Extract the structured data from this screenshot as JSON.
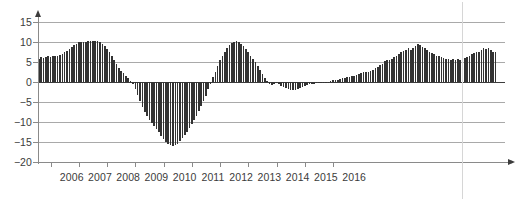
{
  "chart_data": {
    "type": "bar",
    "title": "",
    "subtitle": "",
    "xlabel": "",
    "ylabel": "",
    "grid": true,
    "legend": null,
    "ylim": [
      -20,
      15
    ],
    "ytick_labels": [
      "15",
      "10",
      "5",
      "0",
      "−5",
      "−10",
      "−15",
      "−20"
    ],
    "ytick_values": [
      15,
      10,
      5,
      0,
      -5,
      -10,
      -15,
      -20
    ],
    "xtick_labels": [
      "2006",
      "2007",
      "2008",
      "2009",
      "2010",
      "2011",
      "2012",
      "2013",
      "2014",
      "2015",
      "2016"
    ],
    "xtick_values": [
      2006,
      2007,
      2008,
      2009,
      2010,
      2011,
      2012,
      2013,
      2014,
      2015,
      2016
    ],
    "bar_color": "#333333",
    "gridline_color": "#a9a9a9",
    "zero_line_color": "#3c3c3c",
    "marker_line_color": "#d6d6d6",
    "x_start": 2005.55,
    "x_step": 0.0833333,
    "values": [
      5.8,
      6.2,
      6.1,
      6.3,
      6.4,
      6.3,
      6.5,
      6.4,
      6.6,
      6.8,
      7.0,
      7.4,
      7.8,
      8.2,
      8.8,
      9.2,
      9.6,
      10.0,
      10.1,
      10.1,
      10.1,
      10.2,
      10.2,
      10.3,
      10.3,
      10.2,
      10.0,
      9.6,
      9.0,
      8.2,
      7.4,
      6.4,
      5.4,
      4.4,
      3.6,
      2.8,
      2.2,
      1.6,
      0.9,
      0.2,
      -0.6,
      -1.8,
      -3.2,
      -4.8,
      -6.2,
      -7.6,
      -8.6,
      -9.4,
      -10.2,
      -11.0,
      -11.8,
      -12.6,
      -13.4,
      -14.2,
      -14.9,
      -15.4,
      -15.8,
      -16.0,
      -15.8,
      -15.4,
      -14.8,
      -14.0,
      -13.2,
      -12.4,
      -11.4,
      -10.4,
      -9.4,
      -8.4,
      -7.2,
      -6.0,
      -4.8,
      -3.4,
      -1.8,
      -0.4,
      1.2,
      2.6,
      4.0,
      5.4,
      6.6,
      7.6,
      8.4,
      9.2,
      9.8,
      10.1,
      10.2,
      10.1,
      9.6,
      9.0,
      8.2,
      7.4,
      6.6,
      5.8,
      5.0,
      4.0,
      3.0,
      2.0,
      1.0,
      0.2,
      -0.4,
      -0.8,
      -0.5,
      -0.3,
      -0.6,
      -0.9,
      -1.2,
      -1.5,
      -1.8,
      -2.0,
      -2.1,
      -2.0,
      -1.8,
      -1.5,
      -1.2,
      -0.9,
      -0.7,
      -0.6,
      -0.5,
      -0.4,
      -0.3,
      -0.3,
      -0.2,
      -0.2,
      -0.1,
      0.1,
      0.3,
      0.5,
      0.4,
      0.6,
      0.8,
      1.0,
      1.1,
      1.3,
      1.2,
      1.4,
      1.6,
      1.8,
      2.0,
      2.2,
      2.4,
      2.6,
      2.6,
      2.8,
      3.1,
      3.4,
      3.8,
      4.2,
      4.6,
      5.2,
      5.6,
      5.4,
      5.8,
      6.2,
      6.6,
      7.0,
      7.4,
      7.8,
      8.0,
      8.4,
      8.0,
      8.6,
      9.0,
      9.4,
      9.2,
      8.8,
      8.4,
      8.0,
      7.6,
      7.2,
      7.0,
      6.6,
      6.4,
      6.2,
      6.0,
      5.8,
      5.7,
      5.6,
      5.7,
      5.6,
      5.8,
      5.6,
      5.8,
      6.0,
      6.2,
      6.6,
      7.0,
      7.2,
      7.6,
      7.4,
      8.0,
      8.6,
      8.2,
      8.4,
      8.0,
      7.6,
      7.4
    ]
  }
}
